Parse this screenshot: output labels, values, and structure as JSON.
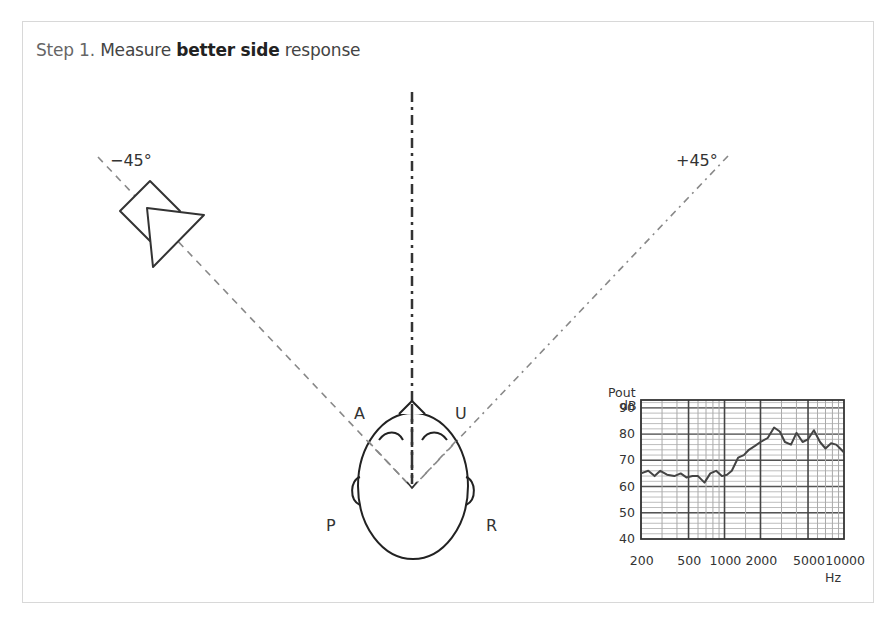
{
  "title": {
    "step": "Step 1.",
    "pre": "Measure",
    "bold": "better side",
    "post": "response"
  },
  "angles": {
    "left": "−45°",
    "right": "+45°"
  },
  "head_labels": {
    "a": "A",
    "u": "U",
    "p": "P",
    "r": "R"
  },
  "icons": {
    "speaker": "loudspeaker-icon",
    "head": "head-top-view-icon"
  },
  "chart_data": {
    "type": "line",
    "title": "",
    "ylabel_line1": "Pout",
    "ylabel_line2": "dB",
    "xlabel": "Hz",
    "xscale": "log",
    "xlim": [
      200,
      10000
    ],
    "ylim": [
      40,
      95
    ],
    "xticks": [
      "200",
      "500",
      "1000",
      "2000",
      "5000",
      "10000"
    ],
    "yticks": [
      "90",
      "80",
      "70",
      "60",
      "50",
      "40"
    ],
    "grid": true,
    "series": [
      {
        "name": "better side response",
        "x": [
          200,
          230,
          260,
          290,
          330,
          380,
          430,
          480,
          540,
          600,
          680,
          760,
          850,
          950,
          1050,
          1150,
          1300,
          1450,
          1600,
          1800,
          2000,
          2300,
          2600,
          2900,
          3200,
          3600,
          4000,
          4500,
          5000,
          5600,
          6300,
          7000,
          7800,
          8600,
          9300,
          10000
        ],
        "y": [
          65,
          66,
          64,
          66,
          64.5,
          64,
          65,
          63.5,
          64,
          64,
          61.5,
          65,
          66,
          64,
          64.5,
          66,
          71,
          72,
          74,
          75.5,
          77,
          78.5,
          82.5,
          81,
          77,
          76,
          80.5,
          77,
          78,
          81.5,
          77,
          74.5,
          76.5,
          76,
          74.5,
          73
        ]
      }
    ]
  }
}
